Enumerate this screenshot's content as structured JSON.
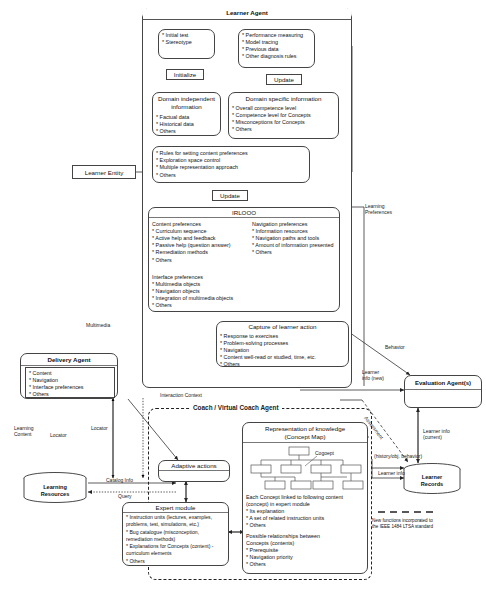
{
  "diagram": {
    "legend": {
      "text_line1": "New functions incorporated to",
      "text_line2": "the IEEE 1484 LTSA standard"
    }
  },
  "learner_agent": {
    "title": "Learner Agent",
    "initial": {
      "items": [
        "* Initial test",
        "* Stereotype"
      ]
    },
    "performance": {
      "items": [
        "* Performance measuring",
        "* Model tracing",
        "* Previous data",
        "* Other diagnosis rules"
      ]
    },
    "initialize_label": "Initialize",
    "update_label_1": "Update",
    "domain_independent": {
      "title_l1": "Domain independent",
      "title_l2": "information",
      "items": [
        "* Factual data",
        "* Historical data",
        "* Others"
      ]
    },
    "domain_specific": {
      "title": "Domain specific information",
      "items": [
        "* Overall competence level",
        "* Competence level for Concepts",
        "* Misconceptions for Concepts",
        "* Others"
      ]
    },
    "rules": {
      "items": [
        "* Rules for setting content preferences",
        "* Exploration space control",
        "* Multiple representation approach",
        "* Others"
      ]
    },
    "update_label_2": "Update",
    "irlooo": {
      "title": "IRLOOO",
      "content_pref_title": "Content preferences",
      "content_pref_items": [
        "* Curriculum sequence",
        "* Active help and feedback",
        "* Passive help (question answer)",
        "* Remediation methods",
        "* Others"
      ],
      "nav_pref_title": "Navigation preferences",
      "nav_pref_items": [
        "* Information resources",
        "* Navigation paths and tools",
        "* Amount of information presented",
        "* Others"
      ],
      "iface_pref_title": "Interface preferences",
      "iface_pref_items": [
        "* Multimedia objects",
        "* Navigation objects",
        "* Integration of multimedia objects",
        "* Others"
      ]
    },
    "capture": {
      "title": "Capture of learner action",
      "items": [
        "* Response to exercises",
        "* Problem-solving processes",
        "* Navigation",
        "* Content well-read or studied, time, etc.",
        "* Others"
      ]
    }
  },
  "learner_entity": {
    "label": "Learner Entity"
  },
  "delivery_agent": {
    "title": "Delivery Agent",
    "items": [
      "* Content",
      "* Navigation",
      "* Interface preferences",
      "* Others"
    ]
  },
  "learning_resources": {
    "label_l1": "Learning",
    "label_l2": "Resources"
  },
  "evaluation_agent": {
    "title": "Evaluation Agent(s)"
  },
  "learner_records": {
    "label_l1": "Learner",
    "label_l2": "Records"
  },
  "coach_agent": {
    "title": "Coach / Virtual Coach Agent",
    "adaptive_actions": {
      "title": "Adaptive actions"
    },
    "expert_module": {
      "title": "Expert module",
      "items": [
        "* Instruction units (lectures, examples,",
        "   problems, test, simulations, etc.)",
        "* Bug catalogue (misconception,",
        "   remediation methods)",
        "* Explanations for Concepts (content) -",
        "   curriculum elements",
        "* Others"
      ]
    },
    "knowledge": {
      "title_l1": "Representation of knowledge",
      "title_l2": "(Concept Map)",
      "concept_label": "Cogoept",
      "body1_l1": "Each Concept linked to following content",
      "body1_l2": "(concept) in expert module",
      "body1_items": [
        "* Its explanation",
        "* A set of related instruction units",
        "* Others"
      ],
      "body2_l1": "Possible relationships between",
      "body2_l2": "Concepts (contents)",
      "body2_items": [
        "* Prerequisite",
        "* Navigation priority",
        "* Others"
      ]
    }
  },
  "edge_labels": {
    "multimedia": "Multimedia",
    "learning_preferences_l1": "Learning",
    "learning_preferences_l2": "Preferences",
    "behavior": "Behavior",
    "learner_info_new_l1": "Learner",
    "learner_info_new_l2": "info (new)",
    "learner_info_current_l1": "Learner info",
    "learner_info_current_l2": "(current)",
    "interaction_context": "Interaction Context",
    "learning_content_l1": "Learning",
    "learning_content_l2": "Content",
    "locator_left": "Locator",
    "locator_mid": "Locator",
    "catalog_info": "Catalog Info",
    "query": "Query",
    "assessment": "Assessment",
    "history_behavior": "(history/obj. behavior)",
    "learner_info": "Learner info"
  }
}
